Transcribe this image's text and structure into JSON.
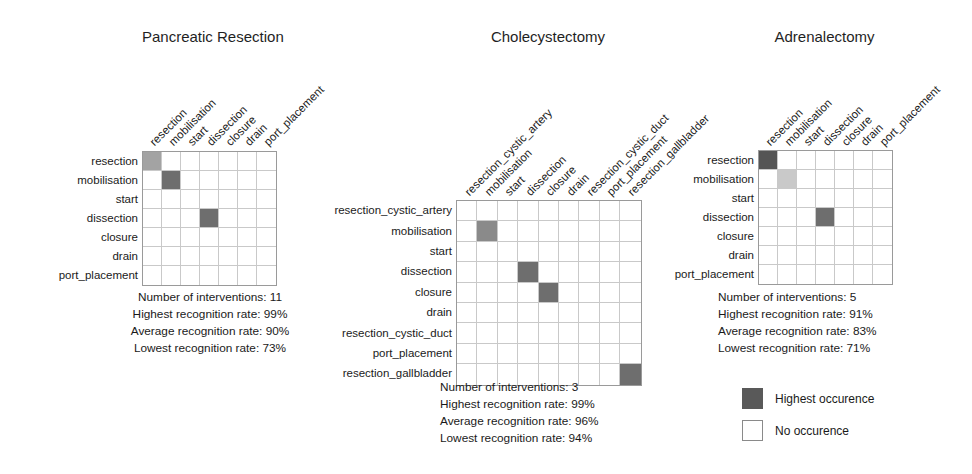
{
  "figure": {
    "colors": {
      "highest": "#595959",
      "dark": "#6e6e6e",
      "mid": "#a3a3a3",
      "light": "#c9c9c9",
      "empty": "#ffffff",
      "grid_line": "#c9c9c9",
      "grid_border": "#9a9a9a",
      "text": "#1a1a1a"
    }
  },
  "panels": [
    {
      "id": "pancreatic-resection",
      "title": "Pancreatic Resection",
      "size": 7,
      "row_labels": [
        "resection",
        "mobilisation",
        "start",
        "dissection",
        "closure",
        "drain",
        "port_placement"
      ],
      "col_labels": [
        "resection",
        "mobilisation",
        "start",
        "dissection",
        "closure",
        "drain",
        "port_placement"
      ],
      "cells": [
        {
          "row": 0,
          "col": 0,
          "shade": "#a3a3a3"
        },
        {
          "row": 1,
          "col": 1,
          "shade": "#6e6e6e"
        },
        {
          "row": 3,
          "col": 3,
          "shade": "#6e6e6e"
        }
      ],
      "stats": {
        "interventions": "Number of interventions: 11",
        "highest": "Highest recognition rate: 99%",
        "average": "Average recognition rate: 90%",
        "lowest": "Lowest recognition rate: 73%"
      }
    },
    {
      "id": "cholecystectomy",
      "title": "Cholecystectomy",
      "size": 9,
      "row_labels": [
        "resection_cystic_artery",
        "mobilisation",
        "start",
        "dissection",
        "closure",
        "drain",
        "resection_cystic_duct",
        "port_placement",
        "resection_gallbladder"
      ],
      "col_labels": [
        "resection_cystic_artery",
        "mobilisation",
        "start",
        "dissection",
        "closure",
        "drain",
        "resection_cystic_duct",
        "port_placement",
        "resection_gallbladder"
      ],
      "cells": [
        {
          "row": 1,
          "col": 1,
          "shade": "#8a8a8a"
        },
        {
          "row": 3,
          "col": 3,
          "shade": "#6e6e6e"
        },
        {
          "row": 4,
          "col": 4,
          "shade": "#6e6e6e"
        },
        {
          "row": 8,
          "col": 8,
          "shade": "#6e6e6e"
        }
      ],
      "stats": {
        "interventions": "Number of interventions: 3",
        "highest": "Highest recognition rate: 99%",
        "average": "Average recognition rate: 96%",
        "lowest": "Lowest recognition rate: 94%"
      }
    },
    {
      "id": "adrenalectomy",
      "title": "Adrenalectomy",
      "size": 7,
      "row_labels": [
        "resection",
        "mobilisation",
        "start",
        "dissection",
        "closure",
        "drain",
        "port_placement"
      ],
      "col_labels": [
        "resection",
        "mobilisation",
        "start",
        "dissection",
        "closure",
        "drain",
        "port_placement"
      ],
      "cells": [
        {
          "row": 0,
          "col": 0,
          "shade": "#555555"
        },
        {
          "row": 1,
          "col": 1,
          "shade": "#c9c9c9"
        },
        {
          "row": 3,
          "col": 3,
          "shade": "#6e6e6e"
        }
      ],
      "stats": {
        "interventions": "Number of interventions: 5",
        "highest": "Highest recognition rate: 91%",
        "average": "Average recognition rate: 83%",
        "lowest": "Lowest recognition rate: 71%"
      }
    }
  ],
  "legend": {
    "items": [
      {
        "label": "Highest occurence",
        "color": "#595959",
        "border": "#595959"
      },
      {
        "label": "No occurence",
        "color": "#ffffff",
        "border": "#8a8a8a"
      }
    ]
  }
}
